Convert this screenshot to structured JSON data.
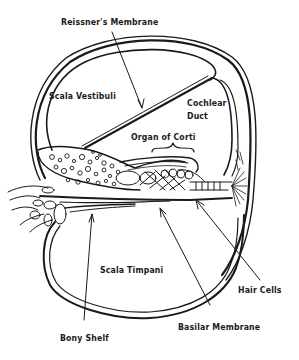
{
  "diagram": {
    "type": "anatomical-cross-section",
    "labels": {
      "reissners_membrane": "Reissner's Membrane",
      "scala_vestibuli": "Scala Vestibuli",
      "cochlear_duct_line1": "Cochlear",
      "cochlear_duct_line2": "Duct",
      "organ_of_corti": "Organ of Corti",
      "scala_timpani": "Scala Timpani",
      "hair_cells": "Hair Cells",
      "basilar_membrane": "Basilar Membrane",
      "bony_shelf": "Bony Shelf"
    },
    "colors": {
      "ink": "#1a1a1a",
      "background": "#ffffff"
    }
  }
}
